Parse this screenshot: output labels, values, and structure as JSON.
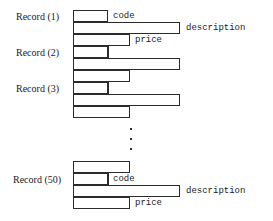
{
  "figure": {
    "geometry": {
      "bar_left": 73,
      "row_height": 12,
      "code_width": 35,
      "description_width": 107,
      "price_width": 57,
      "tick_x": 108
    },
    "colors": {
      "stroke": "#2b2b2b",
      "fill": "#ffffff",
      "text": "#1a1a1a",
      "background": "#ffffff"
    }
  },
  "records": [
    {
      "id": "record-1",
      "label": "Record (1)",
      "label_x": 16,
      "label_y": 11,
      "rows": [
        {
          "field": "code",
          "x": 73,
          "y": 10,
          "width": 35,
          "height": 12,
          "tick": false
        },
        {
          "field": "description",
          "x": 73,
          "y": 22,
          "width": 107,
          "height": 12,
          "tick": false
        },
        {
          "field": "price",
          "x": 73,
          "y": 34,
          "width": 57,
          "height": 12,
          "tick": false
        }
      ]
    },
    {
      "id": "record-2",
      "label": "Record (2)",
      "label_x": 16,
      "label_y": 47,
      "rows": [
        {
          "field": "code",
          "x": 73,
          "y": 46,
          "width": 35,
          "height": 12,
          "tick": true
        },
        {
          "field": "description",
          "x": 73,
          "y": 58,
          "width": 107,
          "height": 12,
          "tick": false
        },
        {
          "field": "price",
          "x": 73,
          "y": 70,
          "width": 57,
          "height": 12,
          "tick": false
        }
      ]
    },
    {
      "id": "record-3",
      "label": "Record (3)",
      "label_x": 16,
      "label_y": 83,
      "rows": [
        {
          "field": "code",
          "x": 73,
          "y": 82,
          "width": 35,
          "height": 12,
          "tick": true
        },
        {
          "field": "description",
          "x": 73,
          "y": 94,
          "width": 107,
          "height": 12,
          "tick": false
        },
        {
          "field": "price",
          "x": 73,
          "y": 106,
          "width": 57,
          "height": 12,
          "tick": false
        }
      ]
    },
    {
      "id": "record-50",
      "label": "Record (50)",
      "label_x": 13,
      "label_y": 174,
      "rows": [
        {
          "field": "price",
          "x": 73,
          "y": 161,
          "width": 57,
          "height": 12,
          "tick": false
        },
        {
          "field": "code",
          "x": 73,
          "y": 173,
          "width": 35,
          "height": 12,
          "tick": true
        },
        {
          "field": "description",
          "x": 73,
          "y": 185,
          "width": 107,
          "height": 12,
          "tick": false
        },
        {
          "field": "price",
          "x": 73,
          "y": 197,
          "width": 57,
          "height": 12,
          "tick": false
        }
      ]
    }
  ],
  "field_labels": [
    {
      "id": "code-label-top",
      "text": "code",
      "x": 113,
      "y": 10
    },
    {
      "id": "description-label-top",
      "text": "description",
      "x": 186,
      "y": 22
    },
    {
      "id": "price-label-top",
      "text": "price",
      "x": 135,
      "y": 34
    },
    {
      "id": "code-label-bottom",
      "text": "code",
      "x": 113,
      "y": 173
    },
    {
      "id": "description-label-bottom",
      "text": "description",
      "x": 186,
      "y": 185
    },
    {
      "id": "price-label-bottom",
      "text": "price",
      "x": 135,
      "y": 197
    }
  ],
  "ellipsis": {
    "id": "vertical-ellipsis",
    "x": 130,
    "dots": [
      128,
      138,
      148
    ]
  }
}
